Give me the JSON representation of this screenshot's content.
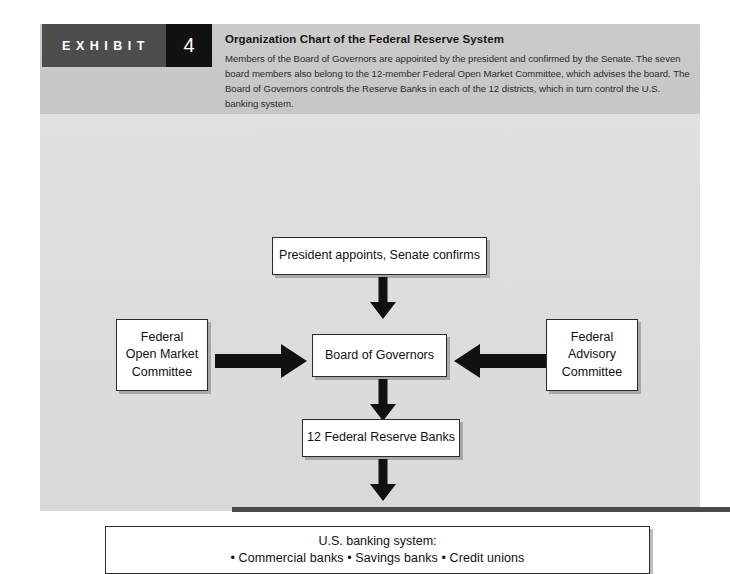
{
  "exhibit": {
    "tag_label": "EXHIBIT",
    "number": "4",
    "title": "Organization Chart of the Federal Reserve System",
    "description": "Members of the Board of Governors are appointed by the president and confirmed by the Senate. The seven board members also belong to the 12-member Federal Open Market Committee, which advises the board. The Board of Governors controls the Reserve Banks in each of the 12 districts, which in turn control the U.S. banking system."
  },
  "diagram": {
    "type": "organization-chart",
    "nodes": [
      {
        "id": "president",
        "label": "President appoints, Senate confirms"
      },
      {
        "id": "fomc",
        "label": "Federal\nOpen Market\nCommittee",
        "line1": "Federal",
        "line2": "Open Market",
        "line3": "Committee"
      },
      {
        "id": "board_of_governors",
        "label": "Board of Governors"
      },
      {
        "id": "fac",
        "label": "Federal\nAdvisory\nCommittee",
        "line1": "Federal",
        "line2": "Advisory",
        "line3": "Committee"
      },
      {
        "id": "reserve_banks",
        "label": "12 Federal Reserve Banks"
      },
      {
        "id": "banking_system",
        "line1": "U.S. banking system:",
        "line2": "• Commercial banks   • Savings banks   • Credit unions"
      }
    ],
    "edges": [
      {
        "from": "president",
        "to": "board_of_governors",
        "direction": "down"
      },
      {
        "from": "fomc",
        "to": "board_of_governors",
        "direction": "right"
      },
      {
        "from": "fac",
        "to": "board_of_governors",
        "direction": "left"
      },
      {
        "from": "board_of_governors",
        "to": "reserve_banks",
        "direction": "down"
      },
      {
        "from": "reserve_banks",
        "to": "banking_system",
        "direction": "down"
      }
    ]
  },
  "colors": {
    "tag_background": "#4d4d4d",
    "number_background": "#111111",
    "header_band": "#c9c9c9",
    "panel_body": "#dcdcdc",
    "box_border": "#2b2b2b",
    "arrow_fill": "#111111",
    "bottom_rule": "#4a4a4a"
  }
}
